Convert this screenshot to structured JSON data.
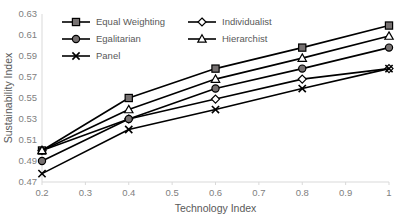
{
  "chart_data": {
    "type": "line",
    "title": "",
    "xlabel": "Technology Index",
    "ylabel": "Sustainability Index",
    "x": [
      0.2,
      0.4,
      0.6,
      0.8,
      1.0
    ],
    "xlim": [
      0.2,
      1.0
    ],
    "ylim": [
      0.47,
      0.63
    ],
    "xticks": [
      "0.2",
      "0.3",
      "0.4",
      "0.5",
      "0.6",
      "0.7",
      "0.8",
      "0.9",
      "1"
    ],
    "xtick_values": [
      0.2,
      0.3,
      0.4,
      0.5,
      0.6,
      0.7,
      0.8,
      0.9,
      1.0
    ],
    "yticks": [
      "0.47",
      "0.49",
      "0.51",
      "0.53",
      "0.55",
      "0.57",
      "0.59",
      "0.61",
      "0.63"
    ],
    "ytick_values": [
      0.47,
      0.49,
      0.51,
      0.53,
      0.55,
      0.57,
      0.59,
      0.61,
      0.63
    ],
    "grid": false,
    "legend_position": "top-inside",
    "series": [
      {
        "name": "Equal Weighting",
        "marker": "square-filled",
        "values": [
          0.5,
          0.55,
          0.578,
          0.598,
          0.619
        ]
      },
      {
        "name": "Individualist",
        "marker": "diamond-open",
        "values": [
          0.5,
          0.53,
          0.549,
          0.568,
          0.578
        ]
      },
      {
        "name": "Egalitarian",
        "marker": "circle-filled",
        "values": [
          0.49,
          0.53,
          0.559,
          0.578,
          0.598
        ]
      },
      {
        "name": "Hierarchist",
        "marker": "triangle-open",
        "values": [
          0.5,
          0.539,
          0.568,
          0.588,
          0.609
        ]
      },
      {
        "name": "Panel",
        "marker": "cross",
        "values": [
          0.478,
          0.52,
          0.539,
          0.559,
          0.578
        ]
      }
    ]
  },
  "colors": {
    "line": "#000000",
    "marker_fill": "#767171",
    "marker_open_fill": "#ffffff",
    "axis": "#d9d9d9",
    "text": "#595959",
    "tick_text": "#808080",
    "background": "#ffffff"
  }
}
